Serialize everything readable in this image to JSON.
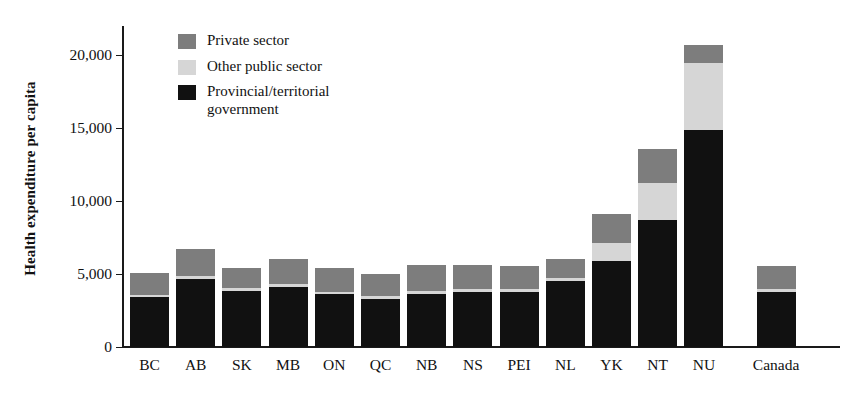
{
  "chart_data": {
    "type": "bar",
    "subtype": "stacked-bar",
    "title": "",
    "xlabel": "",
    "ylabel": "Health expenditure per capita",
    "ylim": [
      0,
      22000
    ],
    "yticks": [
      0,
      5000,
      10000,
      15000,
      20000
    ],
    "ytick_labels": [
      "0",
      "5,000",
      "10,000",
      "15,000",
      "20,000"
    ],
    "grid": false,
    "legend_position": "top-left-inside",
    "categories": [
      "BC",
      "AB",
      "SK",
      "MB",
      "ON",
      "QC",
      "NB",
      "NS",
      "PEI",
      "NL",
      "YK",
      "NT",
      "NU",
      "Canada"
    ],
    "series": [
      {
        "name": "Provincial/territorial government",
        "color": "#111111",
        "values": [
          3400,
          4650,
          3850,
          4100,
          3600,
          3300,
          3650,
          3750,
          3800,
          4500,
          5900,
          8700,
          14900,
          3750
        ]
      },
      {
        "name": "Other public sector",
        "color": "#d6d6d6",
        "values": [
          180,
          200,
          200,
          200,
          200,
          180,
          200,
          200,
          200,
          200,
          1200,
          2550,
          4550,
          200
        ]
      },
      {
        "name": "Private sector",
        "color": "#7d7d7d",
        "values": [
          1520,
          1850,
          1350,
          1700,
          1650,
          1520,
          1800,
          1700,
          1550,
          1300,
          2000,
          2350,
          1250,
          1600
        ]
      }
    ],
    "totals": [
      5100,
      6700,
      5400,
      6000,
      5450,
      5000,
      5650,
      5650,
      5550,
      6000,
      9100,
      13600,
      20700,
      5550
    ]
  },
  "legend": {
    "items": [
      {
        "label": "Private sector",
        "color": "#7d7d7d"
      },
      {
        "label": "Other public sector",
        "color": "#d6d6d6"
      },
      {
        "label": "Provincial/territorial government",
        "color": "#111111"
      }
    ]
  }
}
